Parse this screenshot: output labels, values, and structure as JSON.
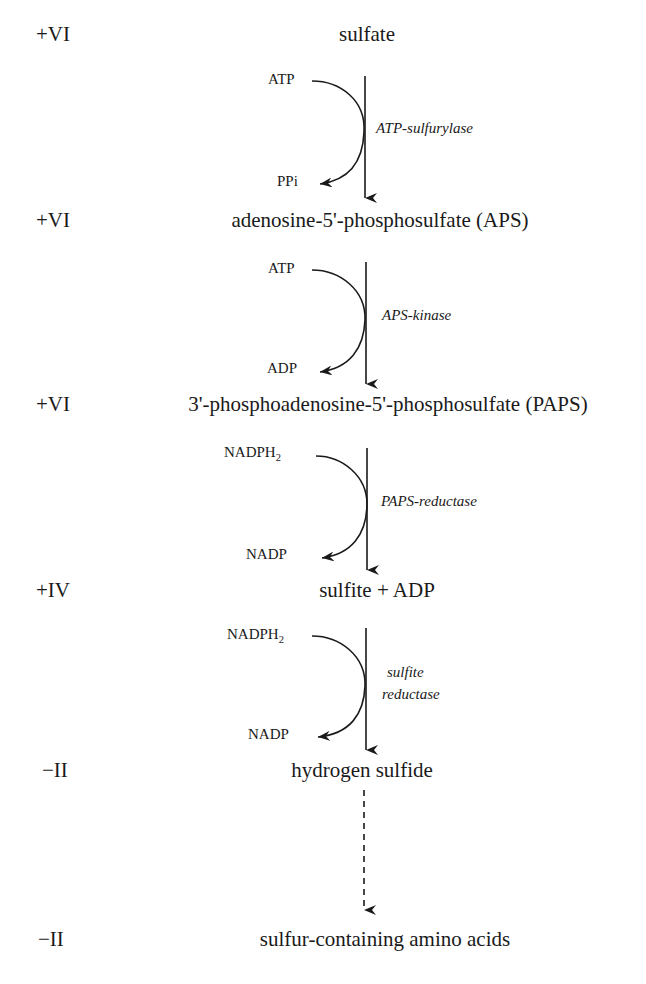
{
  "oxidation_label": "oxidation state of sulfur",
  "steps": [
    {
      "oxidation": "+VI",
      "compound": "sulfate"
    },
    {
      "oxidation": "+VI",
      "compound": "adenosine-5'-phosphosulfate (APS)"
    },
    {
      "oxidation": "+VI",
      "compound": "3'-phosphoadenosine-5'-phosphosulfate (PAPS)"
    },
    {
      "oxidation": "+IV",
      "compound": "sulfite + ADP"
    },
    {
      "oxidation": "−II",
      "compound": "hydrogen sulfide"
    },
    {
      "oxidation": "−II",
      "compound": "sulfur-containing amino acids"
    }
  ],
  "reactions": [
    {
      "in": "ATP",
      "out": "PPi",
      "enzyme": "ATP-sulfurylase"
    },
    {
      "in": "ATP",
      "out": "ADP",
      "enzyme": "APS-kinase"
    },
    {
      "in_base": "NADPH",
      "in_sub": "2",
      "out": "NADP",
      "enzyme": "PAPS-reductase"
    },
    {
      "in_base": "NADPH",
      "in_sub": "2",
      "out": "NADP",
      "enzyme_line1": "sulfite",
      "enzyme_line2": "reductase"
    }
  ],
  "colors": {
    "ink": "#1a1a1a",
    "background": "#ffffff"
  }
}
